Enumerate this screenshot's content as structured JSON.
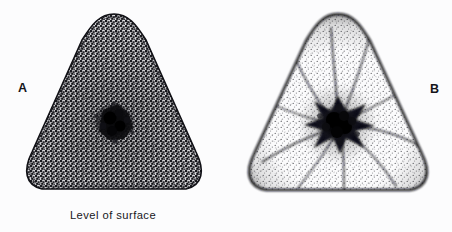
{
  "figure": {
    "background_color": "#fcfcfd",
    "ink_color": "#15151a",
    "width": 452,
    "height": 232,
    "panels": [
      {
        "letter": "A",
        "caption": "Level of surface",
        "subject": "cell-cross-section-surface-level",
        "shape": "rounded-triangle",
        "fill_style": "fine-honeycomb-mesh-stipple",
        "center_feature": "dark-central-blob",
        "center_x": 114,
        "center_y": 122,
        "apex_y": 14,
        "base_y": 192,
        "left_x": 22,
        "right_x": 206,
        "radial_strand_count": 0
      },
      {
        "letter": "B",
        "caption": "Level of nucleus",
        "subject": "cell-cross-section-nucleus-level",
        "shape": "rounded-triangle",
        "fill_style": "graded-stipple-dark-rim",
        "center_feature": "dark-stellate-nucleus",
        "center_x": 338,
        "center_y": 122,
        "apex_y": 14,
        "base_y": 191,
        "left_x": 248,
        "right_x": 430,
        "radial_strand_count": 10
      }
    ]
  }
}
